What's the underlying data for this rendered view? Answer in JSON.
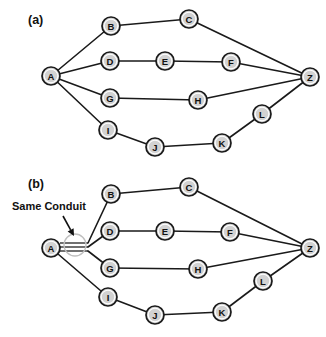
{
  "figure": {
    "width": 326,
    "height": 337,
    "background_color": "#ffffff",
    "node_fill_color": "#d2d2d2",
    "node_stroke_color": "#1a1a1a",
    "edge_color": "#1a1a1a",
    "highlight_ring_color": "#bfbfbf",
    "panels": [
      {
        "id": "a",
        "label": "(a)",
        "label_pos": {
          "x": 28,
          "y": 24
        },
        "nodes": [
          {
            "id": "A",
            "label": "A",
            "cx": 51,
            "cy": 76,
            "r": 9
          },
          {
            "id": "B",
            "label": "B",
            "cx": 111,
            "cy": 26,
            "r": 9
          },
          {
            "id": "C",
            "label": "C",
            "cx": 189,
            "cy": 19,
            "r": 9
          },
          {
            "id": "D",
            "label": "D",
            "cx": 110,
            "cy": 61,
            "r": 9
          },
          {
            "id": "E",
            "label": "E",
            "cx": 165,
            "cy": 61,
            "r": 9
          },
          {
            "id": "F",
            "label": "F",
            "cx": 231,
            "cy": 62,
            "r": 9
          },
          {
            "id": "G",
            "label": "G",
            "cx": 110,
            "cy": 98,
            "r": 9
          },
          {
            "id": "H",
            "label": "H",
            "cx": 198,
            "cy": 100,
            "r": 9
          },
          {
            "id": "I",
            "label": "I",
            "cx": 108,
            "cy": 130,
            "r": 9
          },
          {
            "id": "J",
            "label": "J",
            "cx": 155,
            "cy": 147,
            "r": 9
          },
          {
            "id": "K",
            "label": "K",
            "cx": 222,
            "cy": 143,
            "r": 9
          },
          {
            "id": "L",
            "label": "L",
            "cx": 262,
            "cy": 114,
            "r": 9
          },
          {
            "id": "Z",
            "label": "Z",
            "cx": 310,
            "cy": 77,
            "r": 9
          }
        ],
        "edges": [
          {
            "from": "A",
            "to": "B"
          },
          {
            "from": "B",
            "to": "C"
          },
          {
            "from": "C",
            "to": "Z"
          },
          {
            "from": "A",
            "to": "D"
          },
          {
            "from": "D",
            "to": "E"
          },
          {
            "from": "E",
            "to": "F"
          },
          {
            "from": "F",
            "to": "Z"
          },
          {
            "from": "A",
            "to": "G"
          },
          {
            "from": "G",
            "to": "H"
          },
          {
            "from": "H",
            "to": "Z"
          },
          {
            "from": "A",
            "to": "I"
          },
          {
            "from": "I",
            "to": "J"
          },
          {
            "from": "J",
            "to": "K"
          },
          {
            "from": "K",
            "to": "L"
          },
          {
            "from": "L",
            "to": "Z"
          }
        ],
        "conduit": null,
        "annotation": null
      },
      {
        "id": "b",
        "label": "(b)",
        "label_pos": {
          "x": 28,
          "y": 188
        },
        "nodes": [
          {
            "id": "A",
            "label": "A",
            "cx": 51,
            "cy": 248,
            "r": 9
          },
          {
            "id": "B",
            "label": "B",
            "cx": 111,
            "cy": 194,
            "r": 9
          },
          {
            "id": "C",
            "label": "C",
            "cx": 189,
            "cy": 187,
            "r": 9
          },
          {
            "id": "D",
            "label": "D",
            "cx": 110,
            "cy": 231,
            "r": 9
          },
          {
            "id": "E",
            "label": "E",
            "cx": 165,
            "cy": 231,
            "r": 9
          },
          {
            "id": "F",
            "label": "F",
            "cx": 230,
            "cy": 232,
            "r": 9
          },
          {
            "id": "G",
            "label": "G",
            "cx": 110,
            "cy": 268,
            "r": 9
          },
          {
            "id": "H",
            "label": "H",
            "cx": 198,
            "cy": 269,
            "r": 9
          },
          {
            "id": "I",
            "label": "I",
            "cx": 108,
            "cy": 297,
            "r": 9
          },
          {
            "id": "J",
            "label": "J",
            "cx": 155,
            "cy": 315,
            "r": 9
          },
          {
            "id": "K",
            "label": "K",
            "cx": 222,
            "cy": 312,
            "r": 9
          },
          {
            "id": "L",
            "label": "L",
            "cx": 263,
            "cy": 281,
            "r": 9
          },
          {
            "id": "Z",
            "label": "Z",
            "cx": 310,
            "cy": 248,
            "r": 9
          }
        ],
        "edges": [
          {
            "from": "B",
            "to": "C"
          },
          {
            "from": "C",
            "to": "Z"
          },
          {
            "from": "D",
            "to": "E"
          },
          {
            "from": "E",
            "to": "F"
          },
          {
            "from": "F",
            "to": "Z"
          },
          {
            "from": "G",
            "to": "H"
          },
          {
            "from": "H",
            "to": "Z"
          },
          {
            "from": "A",
            "to": "I"
          },
          {
            "from": "I",
            "to": "J"
          },
          {
            "from": "J",
            "to": "K"
          },
          {
            "from": "K",
            "to": "L"
          },
          {
            "from": "L",
            "to": "Z"
          }
        ],
        "conduit": {
          "description": "bundled parallel links from A to B, D and G sharing one conduit",
          "bundle_start_x": 60,
          "bundle_end_x": 88,
          "bundle_y_top": 243,
          "bundle_y_mid": 247,
          "bundle_y_bottom": 251,
          "highlight_ring": {
            "cx": 75,
            "cy": 245,
            "r": 11
          }
        },
        "annotation": {
          "text": "Same Conduit",
          "text_pos": {
            "x": 12,
            "y": 210
          },
          "arrow_from": {
            "x": 63,
            "y": 216
          },
          "arrow_to": {
            "x": 74,
            "y": 236
          }
        }
      }
    ]
  }
}
